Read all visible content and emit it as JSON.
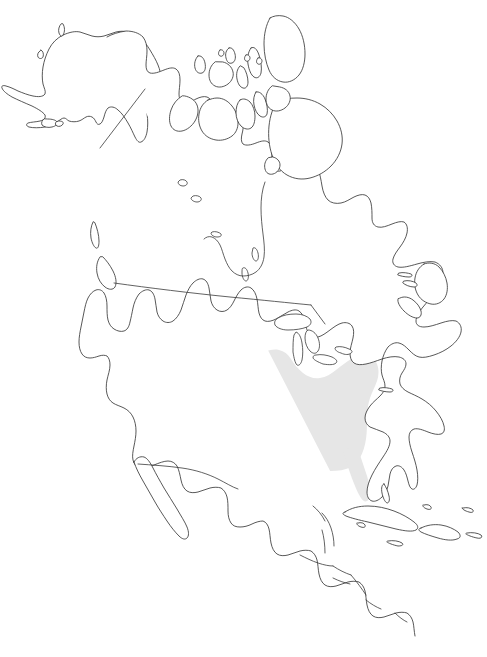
{
  "figure": {
    "kind": "range-distribution-map",
    "region_name": "North America",
    "background_color": "#ffffff",
    "outline_color": "#3a3a3a",
    "range_fill_color": "#e6e6e6",
    "width_px": 487,
    "height_px": 657,
    "has_title": false,
    "has_legend": false,
    "has_axis": false,
    "has_scale_bar": false,
    "has_text_labels": false,
    "projection_hint": "lambert-conformal-conic"
  },
  "layers": [
    {
      "id": "coastlines",
      "label": "Coastlines and island outlines",
      "color": "#3a3a3a",
      "visible": true
    },
    {
      "id": "political-borders",
      "label": "National and internal boundaries",
      "color": "#3a3a3a",
      "visible": true
    },
    {
      "id": "lakes",
      "label": "Great Lakes and inland water bodies",
      "color": "#ffffff",
      "visible": true
    },
    {
      "id": "species-range",
      "label": "Shaded distribution range",
      "color": "#e6e6e6",
      "visible": true
    }
  ],
  "landmasses": [
    {
      "id": "mainland",
      "label": "North American mainland"
    },
    {
      "id": "alaska",
      "label": "Alaska"
    },
    {
      "id": "arctic-archipelago",
      "label": "Canadian Arctic Archipelago"
    },
    {
      "id": "baffin-island",
      "label": "Baffin Island"
    },
    {
      "id": "victoria-island",
      "label": "Victoria Island"
    },
    {
      "id": "ellesmere-island",
      "label": "Ellesmere Island"
    },
    {
      "id": "newfoundland",
      "label": "Newfoundland"
    },
    {
      "id": "nova-scotia",
      "label": "Nova Scotia"
    },
    {
      "id": "vancouver-island",
      "label": "Vancouver Island"
    },
    {
      "id": "baja-california",
      "label": "Baja California"
    },
    {
      "id": "yucatan",
      "label": "Yucatan Peninsula"
    },
    {
      "id": "florida",
      "label": "Florida Peninsula"
    },
    {
      "id": "cuba",
      "label": "Cuba"
    },
    {
      "id": "hispaniola",
      "label": "Hispaniola"
    },
    {
      "id": "puerto-rico",
      "label": "Puerto Rico"
    },
    {
      "id": "jamaica",
      "label": "Jamaica"
    },
    {
      "id": "bahamas",
      "label": "Bahamas"
    },
    {
      "id": "central-america",
      "label": "Central American isthmus"
    }
  ],
  "range_overlay": {
    "label": "Shaded species distribution area",
    "fill": "#e6e6e6",
    "coverage_description": "Central and eastern United States, extending from eastern Texas and the southern Great Plains east to the Atlantic seaboard, north to the upper Midwest and southern Great Lakes, and south across the Gulf Coast states including the Florida peninsula",
    "approx_bbox_px": {
      "x": 186,
      "y": 352,
      "width": 194,
      "height": 128
    }
  },
  "chart_data": {
    "type": "map",
    "title": "",
    "xlabel": "",
    "ylabel": "",
    "categories": [
      "range-present",
      "range-absent"
    ],
    "values": [
      1,
      0
    ],
    "legend": []
  }
}
